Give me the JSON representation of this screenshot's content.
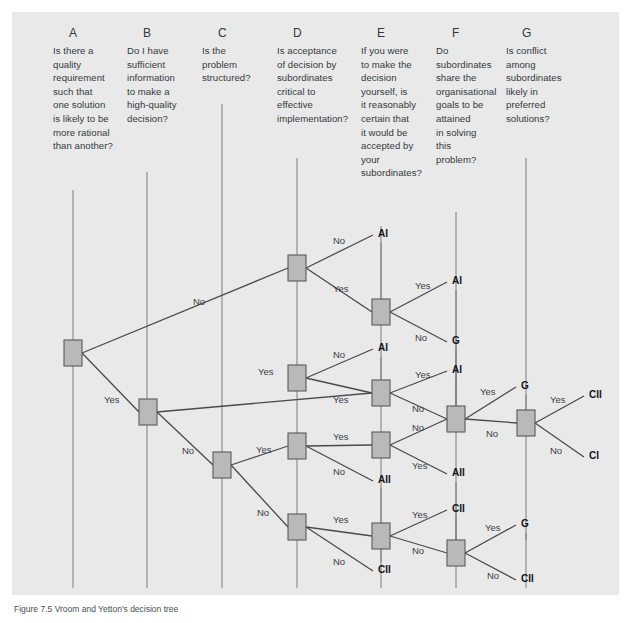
{
  "figure": {
    "caption": "Figure 7.5 Vroom and Yetton's decision tree",
    "background_color": "#e9e9e9",
    "node_fill": "#b9b9b9",
    "node_stroke": "#5a5a5a",
    "line_color": "#4a4a4a"
  },
  "columns": [
    {
      "letter": "A",
      "question": "Is there a quality requirement such that one solution is likely to be more rational than another?",
      "lines": [
        "Is there a",
        "quality",
        "requirement",
        "such that",
        "one solution",
        "is likely to be",
        "more rational",
        "than another?"
      ]
    },
    {
      "letter": "B",
      "question": "Do I have sufficient information to make a high-quality decision?",
      "lines": [
        "Do I have",
        "sufficient",
        "information",
        "to make a",
        "high-quality",
        "decision?"
      ]
    },
    {
      "letter": "C",
      "question": "Is the problem structured?",
      "lines": [
        "Is the",
        "problem",
        "structured?"
      ]
    },
    {
      "letter": "D",
      "question": "Is acceptance of decision by subordinates critical to effective implementation?",
      "lines": [
        "Is acceptance",
        "of decision by",
        "subordinates",
        "critical to",
        "effective",
        "implementation?"
      ]
    },
    {
      "letter": "E",
      "question": "If you were to make the decision yourself, is it reasonably certain that it would be accepted by your subordinates?",
      "lines": [
        "If you were",
        "to make the",
        "decision",
        "yourself, is",
        "it reasonably",
        "certain that",
        "it would be",
        "accepted by",
        "your",
        "subordinates?"
      ]
    },
    {
      "letter": "F",
      "question": "Do subordinates share the organisational goals to be attained in solving this problem?",
      "lines": [
        "Do",
        "subordinates",
        "share the",
        "organisational",
        "goals to be",
        "attained",
        "in solving",
        "this",
        "problem?"
      ]
    },
    {
      "letter": "G",
      "question": "Is conflict among subordinates likely in preferred solutions?",
      "lines": [
        "Is conflict",
        "among",
        "subordinates",
        "likely in",
        "preferred",
        "solutions?"
      ]
    }
  ],
  "chart_data": {
    "type": "diagram",
    "title": "Vroom and Yetton's decision tree",
    "nodes": [
      {
        "id": "A1",
        "column": "A",
        "x": 73,
        "y": 353
      },
      {
        "id": "B1",
        "column": "B",
        "x": 148,
        "y": 412
      },
      {
        "id": "C1",
        "column": "C",
        "x": 222,
        "y": 465
      },
      {
        "id": "D1",
        "column": "D",
        "x": 297,
        "y": 268
      },
      {
        "id": "D2",
        "column": "D",
        "x": 297,
        "y": 378
      },
      {
        "id": "D3",
        "column": "D",
        "x": 297,
        "y": 446
      },
      {
        "id": "D4",
        "column": "D",
        "x": 297,
        "y": 527
      },
      {
        "id": "E1",
        "column": "E",
        "x": 381,
        "y": 312
      },
      {
        "id": "E2",
        "column": "E",
        "x": 381,
        "y": 393
      },
      {
        "id": "E3",
        "column": "E",
        "x": 381,
        "y": 445
      },
      {
        "id": "E4",
        "column": "E",
        "x": 381,
        "y": 536
      },
      {
        "id": "F1",
        "column": "F",
        "x": 456,
        "y": 419
      },
      {
        "id": "F2",
        "column": "F",
        "x": 456,
        "y": 553
      },
      {
        "id": "G1",
        "column": "G",
        "x": 526,
        "y": 423
      }
    ],
    "edges": [
      {
        "from": "A1",
        "to": "D1",
        "label": "No",
        "label_x": 193,
        "label_y": 302
      },
      {
        "from": "A1",
        "to": "B1",
        "label": "Yes",
        "label_x": 104,
        "label_y": 400
      },
      {
        "from": "B1",
        "to": "E2",
        "label": "Yes",
        "label_x": 258,
        "label_y": 372
      },
      {
        "from": "B1",
        "to": "C1",
        "label": "No",
        "label_x": 182,
        "label_y": 451
      },
      {
        "from": "C1",
        "to": "D3",
        "label": "Yes",
        "label_x": 256,
        "label_y": 450
      },
      {
        "from": "C1",
        "to": "D4",
        "label": "No",
        "label_x": 257,
        "label_y": 513
      },
      {
        "from": "D1",
        "to": "out_AI_1",
        "label": "No",
        "label_x": 333,
        "label_y": 241
      },
      {
        "from": "D1",
        "to": "E1",
        "label": "Yes",
        "label_x": 333,
        "label_y": 289
      },
      {
        "from": "E1",
        "to": "out_AI_2",
        "label": "Yes",
        "label_x": 415,
        "label_y": 286
      },
      {
        "from": "E1",
        "to": "out_G_1",
        "label": "No",
        "label_x": 415,
        "label_y": 338
      },
      {
        "from": "D2",
        "to": "out_AI_3",
        "label": "No",
        "label_x": 333,
        "label_y": 355
      },
      {
        "from": "D2",
        "to": "E2",
        "label": "Yes",
        "label_x": 333,
        "label_y": 400
      },
      {
        "from": "E2",
        "to": "out_AI_4",
        "label": "Yes",
        "label_x": 415,
        "label_y": 375
      },
      {
        "from": "E2",
        "to": "F1",
        "label": "No",
        "label_x": 412,
        "label_y": 409
      },
      {
        "from": "D3",
        "to": "E3",
        "label": "Yes",
        "label_x": 333,
        "label_y": 437
      },
      {
        "from": "D3",
        "to": "out_AII_1",
        "label": "No",
        "label_x": 333,
        "label_y": 472
      },
      {
        "from": "E3",
        "to": "F1",
        "label": "No",
        "label_x": 412,
        "label_y": 428
      },
      {
        "from": "E3",
        "to": "out_AII_2",
        "label": "Yes",
        "label_x": 412,
        "label_y": 466
      },
      {
        "from": "F1",
        "to": "out_G_2",
        "label": "Yes",
        "label_x": 480,
        "label_y": 392
      },
      {
        "from": "F1",
        "to": "G1",
        "label": "No",
        "label_x": 486,
        "label_y": 434
      },
      {
        "from": "G1",
        "to": "out_CII_1",
        "label": "Yes",
        "label_x": 550,
        "label_y": 400
      },
      {
        "from": "G1",
        "to": "out_CI_1",
        "label": "No",
        "label_x": 550,
        "label_y": 451
      },
      {
        "from": "D4",
        "to": "E4",
        "label": "Yes",
        "label_x": 333,
        "label_y": 520
      },
      {
        "from": "D4",
        "to": "out_CII_2",
        "label": "No",
        "label_x": 333,
        "label_y": 562
      },
      {
        "from": "E4",
        "to": "out_CII_3",
        "label": "Yes",
        "label_x": 412,
        "label_y": 515
      },
      {
        "from": "E4",
        "to": "F2",
        "label": "No",
        "label_x": 412,
        "label_y": 551
      },
      {
        "from": "F2",
        "to": "out_G_3",
        "label": "Yes",
        "label_x": 485,
        "label_y": 528
      },
      {
        "from": "F2",
        "to": "out_CII_4",
        "label": "No",
        "label_x": 487,
        "label_y": 576
      }
    ],
    "outcomes": [
      {
        "id": "out_AI_1",
        "label": "AI",
        "x": 378,
        "y": 234
      },
      {
        "id": "out_AI_2",
        "label": "AI",
        "x": 452,
        "y": 281
      },
      {
        "id": "out_G_1",
        "label": "G",
        "x": 452,
        "y": 341
      },
      {
        "id": "out_AI_3",
        "label": "AI",
        "x": 378,
        "y": 348
      },
      {
        "id": "out_AI_4",
        "label": "AI",
        "x": 452,
        "y": 370
      },
      {
        "id": "out_G_2",
        "label": "G",
        "x": 521,
        "y": 386
      },
      {
        "id": "out_CII_1",
        "label": "CII",
        "x": 589,
        "y": 395
      },
      {
        "id": "out_CI_1",
        "label": "CI",
        "x": 589,
        "y": 456
      },
      {
        "id": "out_AII_1",
        "label": "AII",
        "x": 378,
        "y": 480
      },
      {
        "id": "out_AII_2",
        "label": "AII",
        "x": 452,
        "y": 473
      },
      {
        "id": "out_CII_3",
        "label": "CII",
        "x": 452,
        "y": 509
      },
      {
        "id": "out_G_3",
        "label": "G",
        "x": 521,
        "y": 524
      },
      {
        "id": "out_CII_2",
        "label": "CII",
        "x": 378,
        "y": 570
      },
      {
        "id": "out_CII_4",
        "label": "CII",
        "x": 521,
        "y": 579
      }
    ]
  }
}
